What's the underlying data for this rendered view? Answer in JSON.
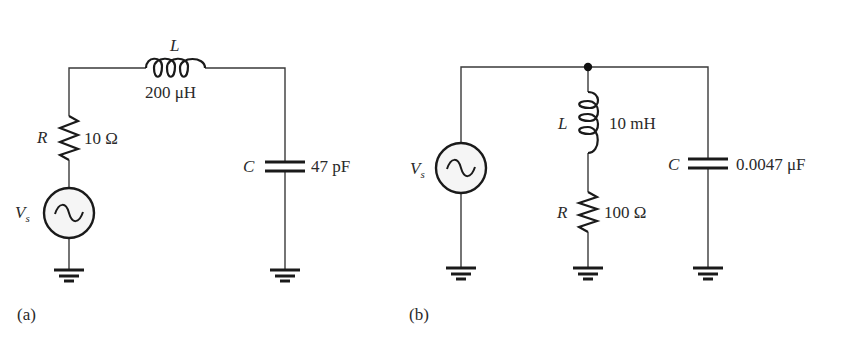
{
  "figure": {
    "circuit_a": {
      "caption": "(a)",
      "topology": "series RLC",
      "source": {
        "symbol": "V",
        "subscript": "s",
        "icon": "ac-source-icon"
      },
      "resistor": {
        "symbol": "R",
        "value": "10 Ω"
      },
      "inductor": {
        "symbol": "L",
        "value": "200 μH"
      },
      "capacitor": {
        "symbol": "C",
        "value": "47 pF"
      }
    },
    "circuit_b": {
      "caption": "(b)",
      "topology": "parallel tank (RL branch ∥ C)",
      "source": {
        "symbol": "V",
        "subscript": "s",
        "icon": "ac-source-icon"
      },
      "inductor": {
        "symbol": "L",
        "value": "10 mH"
      },
      "resistor": {
        "symbol": "R",
        "value": "100 Ω"
      },
      "capacitor": {
        "symbol": "C",
        "value": "0.0047 μF"
      }
    }
  },
  "colors": {
    "wire": "#3a3a3a",
    "component": "#1a1a1a",
    "text": "#2a2a2a",
    "background": "#ffffff"
  }
}
